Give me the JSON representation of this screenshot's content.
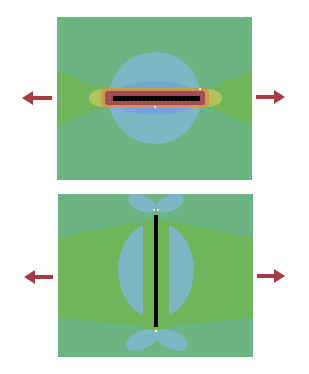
{
  "figure": {
    "colors": {
      "background": "#ffffff",
      "field_base": "#6ab482",
      "field_green": "#6fb55a",
      "field_blue": "#7ab6c4",
      "field_blue_deep": "#6fa8cf",
      "hotspot_yellow": "#c9c85a",
      "hotspot_orange": "#c89a4a",
      "hotspot_red": "#a24a52",
      "crack": "#000000",
      "arrow": "#a63a45"
    },
    "panels": [
      {
        "name": "crack-perpendicular-to-load",
        "crack_orientation": "horizontal",
        "load_direction": "horizontal tension (arrows left and right)"
      },
      {
        "name": "crack-parallel-to-load",
        "crack_orientation": "vertical",
        "load_direction": "horizontal tension (arrows left and right)"
      }
    ]
  }
}
